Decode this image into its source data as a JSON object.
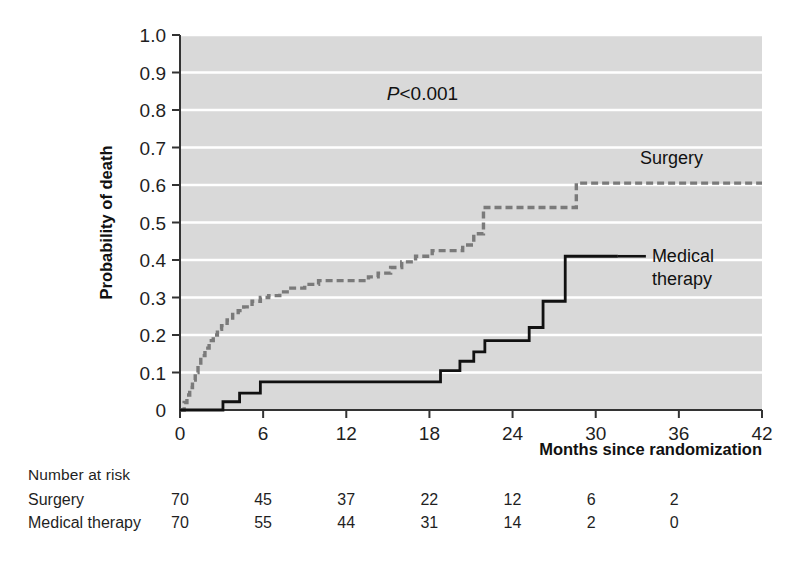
{
  "figure": {
    "background_color": "#ffffff",
    "plot_bg_color": "#d9d9d9",
    "gridline_color": "#ffffff",
    "axis_color": "#333333"
  },
  "annotation": {
    "p_value_symbol": "P",
    "p_value_text": "<0.001"
  },
  "series_labels": {
    "surgery": "Surgery",
    "medical_line1": "Medical",
    "medical_line2": "therapy"
  },
  "risk_table": {
    "title": "Number at risk",
    "column_months": [
      0,
      6,
      12,
      18,
      24,
      30,
      36
    ],
    "rows": [
      {
        "label": "Surgery",
        "values": [
          70,
          45,
          37,
          22,
          12,
          6,
          2
        ]
      },
      {
        "label": "Medical therapy",
        "values": [
          70,
          55,
          44,
          31,
          14,
          2,
          0
        ]
      }
    ]
  },
  "chart_data": {
    "type": "line",
    "title": "",
    "subtitle": "",
    "xlabel": "Months since randomization",
    "ylabel": "Probability of death",
    "xlim": [
      0,
      42
    ],
    "ylim": [
      0,
      1.0
    ],
    "xticks": [
      0,
      6,
      12,
      18,
      24,
      30,
      36,
      42
    ],
    "xticklabels": [
      "0",
      "6",
      "12",
      "18",
      "24",
      "30",
      "36",
      "42"
    ],
    "yticks": [
      0,
      0.1,
      0.2,
      0.3,
      0.4,
      0.5,
      0.6,
      0.7,
      0.8,
      0.9,
      1.0
    ],
    "yticklabels": [
      "0",
      "0.1",
      "0.2",
      "0.3",
      "0.4",
      "0.5",
      "0.6",
      "0.7",
      "0.8",
      "0.9",
      "1.0"
    ],
    "grid": "horizontal",
    "legend_position": "inline-right",
    "annotations": [
      {
        "text": "P<0.001",
        "x": 17.5,
        "y": 0.845
      },
      {
        "text": "Surgery",
        "x": 33.2,
        "y": 0.655
      },
      {
        "text": "Medical therapy",
        "x": 31.5,
        "y": 0.42
      }
    ],
    "series": [
      {
        "name": "Surgery",
        "style": "dashed",
        "color": "#7a7a7a",
        "step": "post",
        "x": [
          0,
          0.3,
          0.5,
          0.7,
          0.9,
          1.1,
          1.3,
          1.5,
          1.8,
          2.1,
          2.4,
          2.7,
          3.0,
          3.4,
          3.8,
          4.2,
          4.6,
          5.2,
          5.8,
          6.4,
          7.2,
          8.0,
          9.0,
          10.0,
          13.0,
          13.6,
          14.3,
          15.2,
          16.0,
          17.0,
          18.2,
          20.4,
          21.2,
          21.9,
          27.8,
          28.6,
          42.0
        ],
        "y": [
          0.0,
          0.02,
          0.04,
          0.06,
          0.08,
          0.1,
          0.12,
          0.145,
          0.165,
          0.185,
          0.2,
          0.215,
          0.225,
          0.24,
          0.255,
          0.265,
          0.275,
          0.29,
          0.3,
          0.305,
          0.315,
          0.325,
          0.335,
          0.345,
          0.345,
          0.355,
          0.365,
          0.38,
          0.395,
          0.41,
          0.425,
          0.44,
          0.47,
          0.54,
          0.54,
          0.605,
          0.605
        ]
      },
      {
        "name": "Medical therapy",
        "style": "solid",
        "color": "#111111",
        "step": "post",
        "x": [
          0,
          3.1,
          4.3,
          5.8,
          17.3,
          18.8,
          20.2,
          21.2,
          22.0,
          24.2,
          25.2,
          26.2,
          27.8,
          31.6
        ],
        "y": [
          0.0,
          0.022,
          0.045,
          0.075,
          0.075,
          0.105,
          0.13,
          0.155,
          0.185,
          0.185,
          0.22,
          0.29,
          0.41,
          0.41
        ]
      }
    ]
  }
}
